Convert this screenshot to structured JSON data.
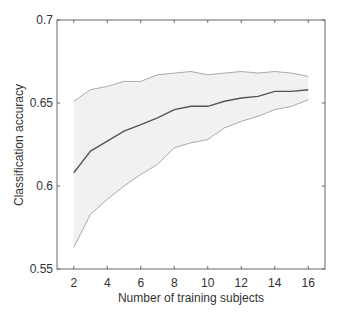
{
  "chart_data": {
    "type": "line",
    "title": "",
    "xlabel": "Number of training subjects",
    "ylabel": "Classification accuracy",
    "xlim": [
      1,
      17
    ],
    "ylim": [
      0.55,
      0.7
    ],
    "xticks": [
      2,
      4,
      6,
      8,
      10,
      12,
      14,
      16
    ],
    "xtick_labels": [
      "2",
      "4",
      "6",
      "8",
      "10",
      "12",
      "14",
      "16"
    ],
    "yticks": [
      0.55,
      0.6,
      0.65,
      0.7
    ],
    "ytick_labels": [
      "0.55",
      "0.6",
      "0.65",
      "0.7"
    ],
    "grid": false,
    "legend": null,
    "x": [
      2,
      3,
      4,
      5,
      6,
      7,
      8,
      9,
      10,
      11,
      12,
      13,
      14,
      15,
      16
    ],
    "series": [
      {
        "name": "mean",
        "role": "line",
        "values": [
          0.608,
          0.621,
          0.627,
          0.633,
          0.637,
          0.641,
          0.646,
          0.648,
          0.648,
          0.651,
          0.653,
          0.654,
          0.657,
          0.657,
          0.658
        ]
      },
      {
        "name": "upper bound",
        "role": "band-upper",
        "values": [
          0.651,
          0.658,
          0.66,
          0.663,
          0.663,
          0.667,
          0.668,
          0.669,
          0.667,
          0.668,
          0.669,
          0.668,
          0.669,
          0.668,
          0.666
        ]
      },
      {
        "name": "lower bound",
        "role": "band-lower",
        "values": [
          0.563,
          0.583,
          0.592,
          0.6,
          0.607,
          0.613,
          0.623,
          0.626,
          0.628,
          0.635,
          0.639,
          0.642,
          0.646,
          0.648,
          0.652
        ]
      }
    ],
    "colors": {
      "mean": "#555555",
      "bound": "#aaaaaa",
      "band_fill": "#f1f1f1",
      "axis": "#666666"
    }
  }
}
